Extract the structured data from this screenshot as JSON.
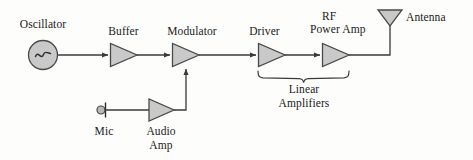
{
  "diagram": {
    "colors": {
      "background": "#fdfdfc",
      "line": "#3a3a3a",
      "shape_fill": "#c9c9c9",
      "shape_stroke": "#4a4a4a",
      "text": "#1a1a1a"
    },
    "labels": {
      "oscillator": "Oscillator",
      "buffer": "Buffer",
      "modulator": "Modulator",
      "driver": "Driver",
      "rf_power_amp_line1": "RF",
      "rf_power_amp_line2": "Power Amp",
      "antenna": "Antenna",
      "mic": "Mic",
      "audio_amp_line1": "Audio",
      "audio_amp_line2": "Amp",
      "linear_line1": "Linear",
      "linear_line2": "Amplifiers"
    },
    "blocks": [
      {
        "name": "oscillator",
        "symbol": "sine-circle",
        "label": "Oscillator"
      },
      {
        "name": "buffer",
        "symbol": "amplifier-triangle",
        "label": "Buffer"
      },
      {
        "name": "modulator",
        "symbol": "amplifier-triangle",
        "label": "Modulator"
      },
      {
        "name": "driver",
        "symbol": "amplifier-triangle",
        "label": "Driver"
      },
      {
        "name": "rf-power-amp",
        "symbol": "amplifier-triangle",
        "label": "RF Power Amp"
      },
      {
        "name": "antenna",
        "symbol": "antenna-triangle",
        "label": "Antenna"
      },
      {
        "name": "mic",
        "symbol": "microphone",
        "label": "Mic"
      },
      {
        "name": "audio-amp",
        "symbol": "amplifier-triangle",
        "label": "Audio Amp"
      }
    ],
    "group_brace": {
      "name": "linear-amplifiers-brace",
      "label": "Linear Amplifiers",
      "covers": [
        "driver",
        "rf-power-amp"
      ]
    },
    "signal_flow": [
      "Oscillator -> Buffer",
      "Buffer -> Modulator",
      "Modulator -> Driver",
      "Driver -> RF Power Amp",
      "RF Power Amp -> Antenna",
      "Mic -> Audio Amp",
      "Audio Amp -> Modulator"
    ]
  }
}
